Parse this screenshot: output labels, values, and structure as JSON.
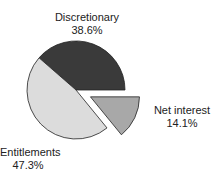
{
  "chart_data": {
    "type": "pie",
    "title": "",
    "categories": [
      "Discretionary",
      "Entitlements",
      "Net interest"
    ],
    "values": [
      38.6,
      47.3,
      14.1
    ],
    "value_labels": [
      "38.6%",
      "47.3%",
      "14.1%"
    ],
    "exploded": [
      "Net interest"
    ],
    "colors": [
      "#3a3a3a",
      "#dcdcdc",
      "#a8a8a8"
    ],
    "legend": "none (direct labels)"
  },
  "labels": {
    "discretionary": {
      "name": "Discretionary",
      "value": "38.6%"
    },
    "entitlements": {
      "name": "Entitlements",
      "value": "47.3%"
    },
    "net_interest": {
      "name": "Net interest",
      "value": "14.1%"
    }
  }
}
